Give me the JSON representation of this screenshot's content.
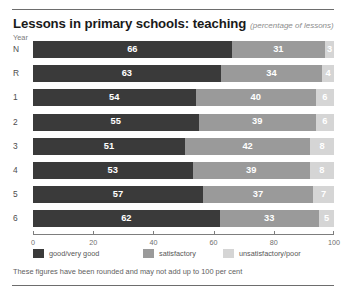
{
  "header": {
    "title": "Lessons in primary schools: teaching",
    "subtitle": "(percentage of lessons)"
  },
  "axis_caption": "Year",
  "footnote": "These figures have been rounded and may not add up to 100 per cent",
  "colors": {
    "good": "#3a3a3a",
    "satisfactory": "#9a9a9a",
    "unsatisfactory": "#d5d5d5",
    "rule": "#6d6d6d",
    "axis": "#7d7d7d",
    "value_text": "#ffffff"
  },
  "chart_data": {
    "type": "bar",
    "orientation": "horizontal",
    "stacked": true,
    "normalized": true,
    "title": "Lessons in primary schools: teaching",
    "subtitle": "(percentage of lessons)",
    "xlabel": "",
    "ylabel": "Year",
    "xlim": [
      0,
      100
    ],
    "xticks": [
      0,
      20,
      40,
      60,
      80,
      100
    ],
    "xticklabels": [
      "0",
      "20",
      "40",
      "60",
      "80",
      "100"
    ],
    "grid": false,
    "legend_position": "bottom",
    "categories": [
      "N",
      "R",
      "1",
      "2",
      "3",
      "4",
      "5",
      "6"
    ],
    "series": [
      {
        "name": "good/very good",
        "color": "#3a3a3a",
        "values": [
          66,
          63,
          54,
          55,
          51,
          53,
          57,
          62
        ]
      },
      {
        "name": "satisfactory",
        "color": "#9a9a9a",
        "values": [
          31,
          34,
          40,
          39,
          42,
          39,
          37,
          33
        ]
      },
      {
        "name": "unsatisfactory/poor",
        "color": "#d5d5d5",
        "values": [
          3,
          4,
          6,
          6,
          8,
          8,
          7,
          5
        ]
      }
    ],
    "annotations": [
      "These figures have been rounded and may not add up to 100 per cent"
    ]
  }
}
